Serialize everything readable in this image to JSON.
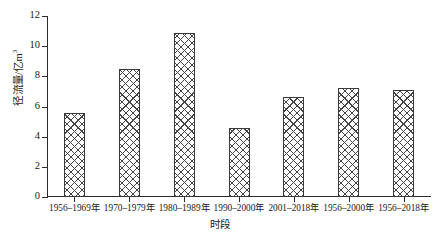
{
  "chart_data": {
    "type": "bar",
    "title": "",
    "xlabel": "时段",
    "ylabel": "径流量/亿m³",
    "ylabel_main": "径流量/亿m",
    "ylabel_exp": "3",
    "categories": [
      "1956–1969年",
      "1970–1979年",
      "1980–1989年",
      "1990–2000年",
      "2001–2018年",
      "1956–2000年",
      "1956–2018年"
    ],
    "values": [
      5.6,
      8.5,
      10.9,
      4.6,
      6.6,
      7.2,
      7.1
    ],
    "ylim": [
      0,
      12
    ],
    "yticks": [
      0,
      2,
      4,
      6,
      8,
      10,
      12
    ],
    "ytick_labels": [
      "0",
      "2",
      "4",
      "6",
      "8",
      "10",
      "12"
    ],
    "grid": false,
    "legend": "none",
    "bar_fill": "crosshatch",
    "bar_edge_color": "#3a3a3a",
    "axis_color": "#2b2b2b"
  }
}
